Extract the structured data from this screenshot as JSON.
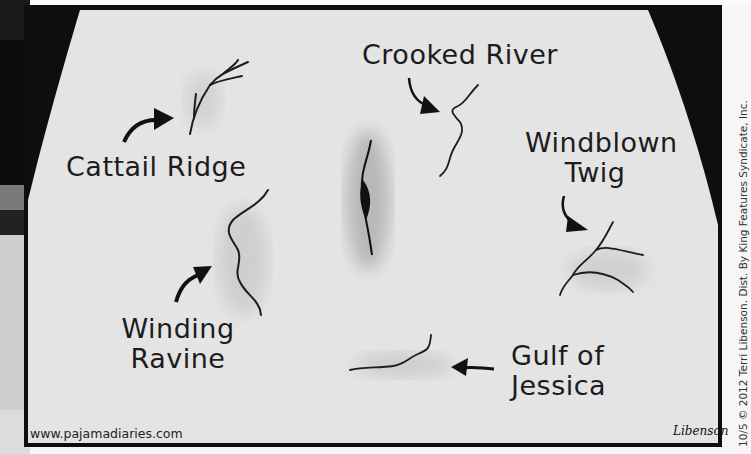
{
  "comic": {
    "labels": {
      "cattail_ridge": "Cattail Ridge",
      "crooked_river": "Crooked River",
      "windblown_twig": [
        "Windblown",
        "Twig"
      ],
      "winding_ravine": [
        "Winding",
        "Ravine"
      ],
      "gulf_of_jessica": [
        "Gulf of",
        "Jessica"
      ]
    },
    "website": "www.pajamadiaries.com",
    "signature": "Libenson",
    "copyright": "10/5 © 2012 Terri Libenson. Dist. By King Features Syndicate, Inc."
  },
  "colors": {
    "background_black": "#0e0e0e",
    "skin": "#e4e4e4",
    "ink": "#1c1c1c"
  }
}
